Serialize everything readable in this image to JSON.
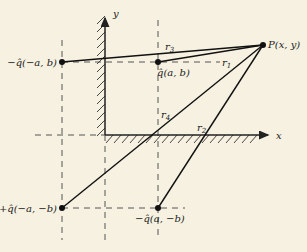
{
  "diagram": {
    "type": "method-of-images",
    "axes": {
      "x_label": "x",
      "y_label": "y"
    },
    "points": [
      {
        "id": "neg_q_neg_a_b",
        "label": "−q̂(−a, b)"
      },
      {
        "id": "q_a_b",
        "label": "q̂(a, b)"
      },
      {
        "id": "P",
        "label": "P(x, y)"
      },
      {
        "id": "pos_q_neg_a_neg_b",
        "label": "+q̂(−a, −b)"
      },
      {
        "id": "neg_q_a_neg_b",
        "label": "−q̂(a, −b)"
      }
    ],
    "distances": [
      {
        "label": "r",
        "sub": "1"
      },
      {
        "label": "r",
        "sub": "2"
      },
      {
        "label": "r",
        "sub": "3"
      },
      {
        "label": "r",
        "sub": "4"
      }
    ]
  }
}
